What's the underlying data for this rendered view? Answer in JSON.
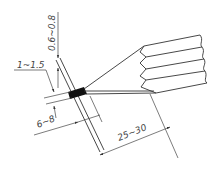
{
  "diagram": {
    "type": "technical-drawing",
    "line_color": "#333333",
    "fill_block_color": "#111111",
    "background": "#ffffff"
  },
  "dimensions": {
    "top_gap": {
      "label": "0.6~0.8",
      "orientation": "vertical"
    },
    "thickness": {
      "label": "1~1.5",
      "orientation": "horizontal"
    },
    "insert_depth": {
      "label": "6~8",
      "orientation": "angled"
    },
    "tuft_length": {
      "label": "25~30",
      "orientation": "angled"
    }
  }
}
